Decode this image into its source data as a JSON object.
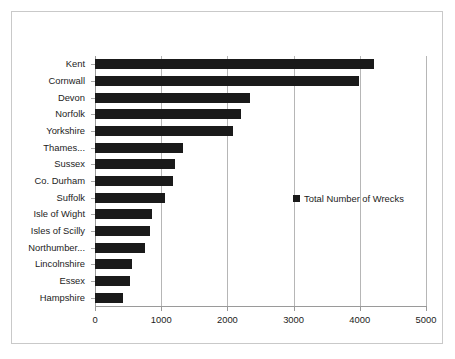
{
  "chart_data": {
    "type": "bar",
    "orientation": "horizontal",
    "title": "",
    "xlabel": "",
    "ylabel": "",
    "xlim": [
      0,
      5000
    ],
    "xticks": [
      0,
      1000,
      2000,
      3000,
      4000,
      5000
    ],
    "xtick_labels": [
      "0",
      "1000",
      "2000",
      "3000",
      "4000",
      "5000"
    ],
    "grid": true,
    "grid_axis": "x",
    "legend": {
      "position": "middle-right-inside",
      "entries": [
        "Total Number of Wrecks"
      ]
    },
    "series": [
      {
        "name": "Total Number of Wrecks",
        "color": "#1a1a1a",
        "values": [
          4220,
          3990,
          2340,
          2210,
          2090,
          1330,
          1210,
          1175,
          1055,
          860,
          830,
          750,
          560,
          535,
          425
        ]
      }
    ],
    "categories": [
      "Kent",
      "Cornwall",
      "Devon",
      "Norfolk",
      "Yorkshire",
      "Thames...",
      "Sussex",
      "Co. Durham",
      "Suffolk",
      "Isle of Wight",
      "Isles of Scilly",
      "Northumber...",
      "Lincolnshire",
      "Essex",
      "Hampshire"
    ]
  },
  "style": {
    "bar_color": "#1a1a1a",
    "gridline_color": "#b6b6b6",
    "axis_color": "#9a9a9a",
    "border_color": "#c9c9c9",
    "text_color": "#1c1c1c",
    "background": "#ffffff"
  }
}
